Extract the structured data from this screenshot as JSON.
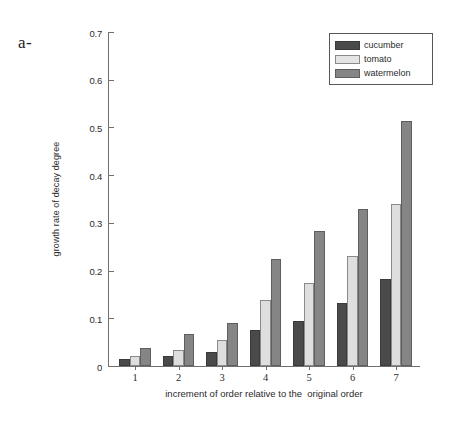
{
  "panel": {
    "label": "a-"
  },
  "legend": {
    "position": "top-right",
    "entries": [
      {
        "label": "cucumber",
        "color": "#4a4a4a"
      },
      {
        "label": "tomato",
        "color": "#dedede"
      },
      {
        "label": "watermelon",
        "color": "#858585"
      }
    ]
  },
  "chart_data": {
    "type": "bar",
    "title": "",
    "xlabel": "increment of order relative to the  original order",
    "ylabel": "growth rate of decay degree",
    "categories": [
      "1",
      "2",
      "3",
      "4",
      "5",
      "6",
      "7"
    ],
    "ylim": [
      0,
      0.7
    ],
    "yticks": [
      0,
      0.1,
      0.2,
      0.3,
      0.4,
      0.5,
      0.6,
      0.7
    ],
    "ytick_labels": [
      "0",
      "0.1",
      "0.2",
      "0.3",
      "0.4",
      "0.5",
      "0.6",
      "0.7"
    ],
    "grid": false,
    "legend_position": "upper right",
    "series": [
      {
        "name": "cucumber",
        "color": "#4a4a4a",
        "values": [
          0.015,
          0.022,
          0.03,
          0.075,
          0.095,
          0.133,
          0.182
        ]
      },
      {
        "name": "tomato",
        "color": "#dedede",
        "values": [
          0.022,
          0.033,
          0.055,
          0.138,
          0.175,
          0.23,
          0.34
        ]
      },
      {
        "name": "watermelon",
        "color": "#858585",
        "values": [
          0.037,
          0.068,
          0.09,
          0.225,
          0.282,
          0.33,
          0.513
        ]
      }
    ]
  }
}
